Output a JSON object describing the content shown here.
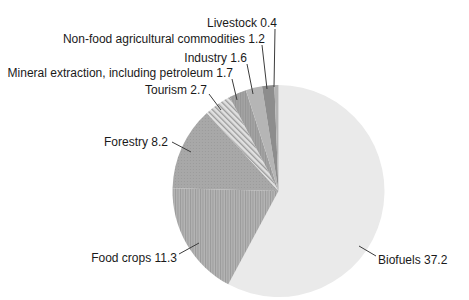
{
  "figure": {
    "background_color": "#ffffff",
    "text_color": "#1a1a1a",
    "leader_line_color": "#3c3c3c"
  },
  "chart_data": {
    "type": "pie",
    "legend": "none",
    "labels_style": "outside with leader lines, format 'Name value'",
    "total": 64.3,
    "categories": [
      "Livestock",
      "Non-food agricultural commodities",
      "Industry",
      "Mineral extraction, including petroleum",
      "Tourism",
      "Forestry",
      "Food crops",
      "Biofuels"
    ],
    "values": [
      0.4,
      1.2,
      1.6,
      1.7,
      2.7,
      8.2,
      11.3,
      37.2
    ],
    "slices": [
      {
        "name": "Livestock",
        "value": 0.4,
        "label": "Livestock 0.4",
        "color": "#b2b2b2",
        "pattern": "solid"
      },
      {
        "name": "Non-food agricultural commodities",
        "value": 1.2,
        "label": "Non-food agricultural commodities 1.2",
        "color": "#8d8d8d",
        "pattern": "solid"
      },
      {
        "name": "Industry",
        "value": 1.6,
        "label": "Industry 1.6",
        "color": "#b5b5b5",
        "pattern": "solid"
      },
      {
        "name": "Mineral extraction, including petroleum",
        "value": 1.7,
        "label": "Mineral extraction, including petroleum 1.7",
        "color": "#a4a4a4",
        "pattern": "vertical-stripes",
        "pattern_color": "#959595"
      },
      {
        "name": "Tourism",
        "value": 2.7,
        "label": "Tourism 2.7",
        "color": "#e0e0e0",
        "pattern": "diagonal-stripes",
        "pattern_color": "#999999"
      },
      {
        "name": "Forestry",
        "value": 8.2,
        "label": "Forestry 8.2",
        "color": "#a8a8a8",
        "pattern": "dots",
        "pattern_color": "#9a9a9a"
      },
      {
        "name": "Food crops",
        "value": 11.3,
        "label": "Food crops 11.3",
        "color": "#b4b4b4",
        "pattern": "vertical-stripes",
        "pattern_color": "#9a9a9a"
      },
      {
        "name": "Biofuels",
        "value": 37.2,
        "label": "Biofuels 37.2",
        "color": "#eaeaea",
        "pattern": "solid"
      }
    ],
    "orientation": "slices clockwise from 12 o'clock starting with Biofuels, then Food crops, Forestry, Tourism, Mineral extraction, Industry, Non-food agricultural commodities, Livestock"
  }
}
